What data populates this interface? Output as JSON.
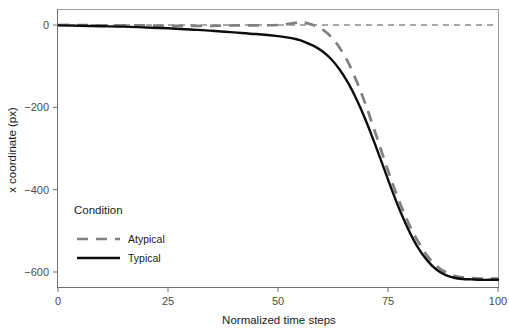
{
  "chart_data": {
    "type": "line",
    "title": "",
    "subtitle": "",
    "xlabel": "Normalized time steps",
    "ylabel": "x coordinate (px)",
    "xlim": [
      0,
      100
    ],
    "ylim": [
      -640,
      30
    ],
    "xticks": [
      0,
      25,
      50,
      75,
      100
    ],
    "xticklabels": [
      "0",
      "25",
      "50",
      "75",
      "100"
    ],
    "yticks": [
      0,
      -200,
      -400,
      -600
    ],
    "yticklabels": [
      "0",
      "−200",
      "−400",
      "−600"
    ],
    "grid": false,
    "legend": {
      "title": "Condition",
      "position": "inside-bottom-left",
      "entries": [
        {
          "name": "Atypical",
          "color": "#808080",
          "style": "dashed",
          "width": 2.6
        },
        {
          "name": "Typical",
          "color": "#0d0d0d",
          "style": "solid",
          "width": 2.4
        }
      ]
    },
    "annotations": [
      {
        "type": "hline",
        "y": 0,
        "style": "dashed",
        "color": "#8c8c8c",
        "label": ""
      }
    ],
    "x": [
      0,
      5,
      10,
      15,
      20,
      25,
      30,
      35,
      40,
      45,
      50,
      52,
      54,
      55,
      56,
      58,
      60,
      62,
      64,
      66,
      68,
      70,
      72,
      74,
      76,
      78,
      80,
      82,
      84,
      86,
      88,
      90,
      92,
      94,
      96,
      98,
      100
    ],
    "series": [
      {
        "name": "Atypical",
        "color": "#808080",
        "style": "dashed",
        "values": [
          0,
          0,
          -1,
          -1,
          -1,
          -2,
          -2,
          -2,
          -1,
          -1,
          0,
          2,
          5,
          7,
          6,
          0,
          -10,
          -28,
          -55,
          -92,
          -140,
          -196,
          -258,
          -322,
          -384,
          -440,
          -489,
          -529,
          -562,
          -585,
          -600,
          -609,
          -613,
          -615,
          -616,
          -616,
          -616
        ]
      },
      {
        "name": "Typical",
        "color": "#0d0d0d",
        "style": "solid",
        "values": [
          -1,
          -2,
          -3,
          -4,
          -6,
          -8,
          -11,
          -14,
          -18,
          -22,
          -27,
          -30,
          -34,
          -37,
          -41,
          -50,
          -63,
          -82,
          -108,
          -142,
          -184,
          -233,
          -288,
          -346,
          -404,
          -458,
          -505,
          -544,
          -573,
          -594,
          -607,
          -614,
          -617,
          -618,
          -619,
          -619,
          -619
        ]
      }
    ]
  },
  "axes": {
    "x_title": "Normalized time steps",
    "y_title": "x coordinate (px)"
  },
  "legend": {
    "title": "Condition",
    "items": [
      {
        "label": "Atypical"
      },
      {
        "label": "Typical"
      }
    ]
  },
  "colors": {
    "atypical": "#808080",
    "typical": "#0d0d0d",
    "zero_line": "#8c8c8c",
    "panel_border": "#9a9a9a",
    "tick_text": "#4d4d4d",
    "background": "#ffffff"
  }
}
